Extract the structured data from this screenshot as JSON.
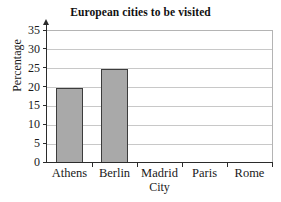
{
  "chart_data": {
    "type": "bar",
    "title": "European cities to be visited",
    "xlabel": "City",
    "ylabel": "Percentage",
    "categories": [
      "Athens",
      "Berlin",
      "Madrid",
      "Paris",
      "Rome"
    ],
    "values": [
      20,
      25,
      0,
      0,
      0
    ],
    "ylim": [
      0,
      35
    ],
    "ytick_labels": [
      "0",
      "5",
      "10",
      "15",
      "20",
      "25",
      "30",
      "35"
    ],
    "ytick_values": [
      0,
      5,
      10,
      15,
      20,
      25,
      30,
      35
    ],
    "ytick_step": 5,
    "grid": "horizontal",
    "legend": "none",
    "bar_fill_color": "#a9a9a9",
    "bar_edge_color": "#3c3c3c",
    "gridline_color": "#c8c8c8",
    "axis_color": "#2b2b2b",
    "background_color": "#ffffff"
  }
}
